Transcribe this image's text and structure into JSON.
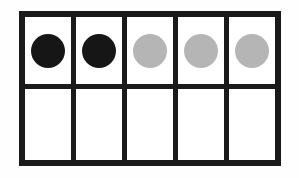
{
  "diagram": {
    "type": "ten-frame",
    "rows": 2,
    "columns": 5,
    "counts": {
      "dark_counters": 2,
      "light_counters": 3,
      "filled_cells": 5,
      "empty_cells": 5,
      "total_cells": 10
    },
    "colors": {
      "background": "#fefefe",
      "frame_lines": "#1a1a1a",
      "cell_background": "#ffffff",
      "dark_counter": "#161616",
      "light_counter": "#b5b5b5"
    },
    "cells": [
      {
        "row": 0,
        "col": 0,
        "counter": "dark"
      },
      {
        "row": 0,
        "col": 1,
        "counter": "dark"
      },
      {
        "row": 0,
        "col": 2,
        "counter": "light"
      },
      {
        "row": 0,
        "col": 3,
        "counter": "light"
      },
      {
        "row": 0,
        "col": 4,
        "counter": "light"
      },
      {
        "row": 1,
        "col": 0,
        "counter": "none"
      },
      {
        "row": 1,
        "col": 1,
        "counter": "none"
      },
      {
        "row": 1,
        "col": 2,
        "counter": "none"
      },
      {
        "row": 1,
        "col": 3,
        "counter": "none"
      },
      {
        "row": 1,
        "col": 4,
        "counter": "none"
      }
    ]
  }
}
